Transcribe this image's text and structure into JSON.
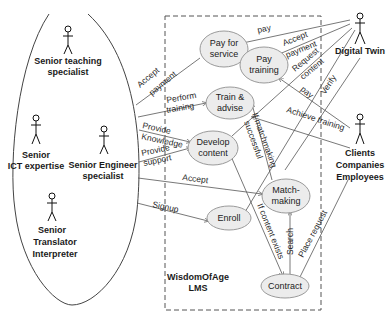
{
  "system": {
    "name_line1": "WisdomOfAge",
    "name_line2": "LMS"
  },
  "actors": {
    "teaching": {
      "line1": "Senior teaching",
      "line2": "specialist"
    },
    "ict": {
      "line1": "Senior",
      "line2": "ICT expertise"
    },
    "engineer": {
      "line1": "Senior Engineer",
      "line2": "specialist"
    },
    "translator": {
      "line1": "Senior",
      "line2": "Translator",
      "line3": "Interpreter"
    },
    "digital_twin": {
      "line1": "Digital Twin"
    },
    "clients": {
      "line1": "Clients",
      "line2": "Companies",
      "line3": "Employees"
    }
  },
  "use_cases": {
    "pay_for_service": {
      "line1": "Pay for",
      "line2": "service"
    },
    "pay_training": {
      "line1": "Pay",
      "line2": "training"
    },
    "train_advise": {
      "line1": "Train &",
      "line2": "advise"
    },
    "develop_content": {
      "line1": "Develop",
      "line2": "content"
    },
    "matchmaking": {
      "line1": "Match-",
      "line2": "making"
    },
    "enroll": {
      "line1": "Enroll"
    },
    "contract": {
      "line1": "Contract"
    }
  },
  "edges": {
    "pay": "pay",
    "accept_payment_dt_1": "Accept",
    "accept_payment_dt_2": "payment",
    "request_content_1": "Request",
    "request_content_2": "content",
    "pay_dt": "pay",
    "verify": "Verify",
    "achieve_training": "Achieve training",
    "accept_payment_seniors_1": "Accept",
    "accept_payment_seniors_2": "payment",
    "perform_training_1": "Perform",
    "perform_training_2": "training",
    "provide_knowledge_1": "Provide",
    "provide_knowledge_2": "Knowledge",
    "provide_support_1": "Provide",
    "provide_support_2": "support",
    "accept": "Accept",
    "signup": "Signup",
    "if_matchmaking_1": "If matchmaking",
    "if_matchmaking_2": "successful",
    "if_content_exists": "If content exists",
    "search": "Search",
    "place_request": "Place request"
  }
}
